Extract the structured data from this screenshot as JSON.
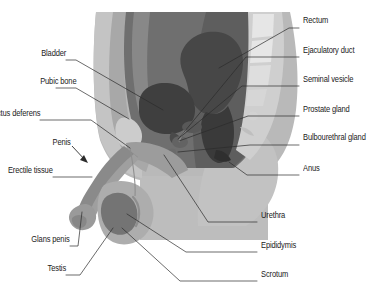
{
  "figure": {
    "type": "anatomical-diagram",
    "width": 376,
    "height": 301,
    "background_color": "#ffffff"
  },
  "palette": {
    "background": "#ffffff",
    "skin_outer": "#b9b9b9",
    "body_light": "#c4c4c4",
    "body_mid": "#a8a8a8",
    "abdomen_dark": "#6f6f6f",
    "abdomen_darker": "#5e5e5e",
    "bladder": "#3f3f3f",
    "rectum": "#474747",
    "rectum_lower": "#3a3a3a",
    "bone_light": "#d9d9d9",
    "vertebra": "#e3e3e3",
    "penis_shaft": "#8a8a8a",
    "glans": "#9a9a9a",
    "testis": "#747474",
    "scrotum": "#adadad",
    "thigh": "#bdbdbd",
    "leader_line": "#2b2b2b",
    "label_text": "#1a1a1a"
  },
  "labels": {
    "left": [
      {
        "id": "bladder",
        "text": "Bladder",
        "x": 97,
        "y": 53,
        "align": "right"
      },
      {
        "id": "pubic-bone",
        "text": "Pubic bone",
        "x": 97,
        "y": 81,
        "align": "right"
      },
      {
        "id": "ductus-deferens",
        "text": "Ductus deferens",
        "x": 97,
        "y": 113,
        "align": "right"
      },
      {
        "id": "penis",
        "text": "Penis",
        "x": 79,
        "y": 142,
        "align": "right"
      },
      {
        "id": "erectile-tissue",
        "text": "Erectile tissue",
        "x": 97,
        "y": 170,
        "align": "right"
      },
      {
        "id": "glans-penis",
        "text": "Glans penis",
        "x": 97,
        "y": 239,
        "align": "right"
      },
      {
        "id": "testis",
        "text": "Testis",
        "x": 97,
        "y": 268,
        "align": "right"
      }
    ],
    "right": [
      {
        "id": "rectum",
        "text": "Rectum",
        "x": 303,
        "y": 20,
        "align": "left"
      },
      {
        "id": "ejaculatory-duct",
        "text": "Ejaculatory duct",
        "x": 303,
        "y": 50,
        "align": "left"
      },
      {
        "id": "seminal-vesicle",
        "text": "Seminal vesicle",
        "x": 303,
        "y": 79,
        "align": "left"
      },
      {
        "id": "prostate-gland",
        "text": "Prostate gland",
        "x": 303,
        "y": 109,
        "align": "left"
      },
      {
        "id": "bulbourethral-gland",
        "text": "Bulbourethral gland",
        "x": 303,
        "y": 137,
        "align": "left"
      },
      {
        "id": "anus",
        "text": "Anus",
        "x": 303,
        "y": 168,
        "align": "left"
      },
      {
        "id": "urethra",
        "text": "Urethra",
        "x": 261,
        "y": 215,
        "align": "left"
      },
      {
        "id": "epididymis",
        "text": "Epididymis",
        "x": 261,
        "y": 245,
        "align": "left"
      },
      {
        "id": "scrotum",
        "text": "Scrotum",
        "x": 261,
        "y": 274,
        "align": "left"
      }
    ]
  },
  "leader_lines": {
    "stroke_color": "#2b2b2b",
    "stroke_width": 0.7,
    "items": [
      {
        "id": "leader-bladder",
        "points": "66,60 76,60 163,110"
      },
      {
        "id": "leader-pubic-bone",
        "points": "56,88 76,88 129,119"
      },
      {
        "id": "leader-ductus-deferens",
        "points": "40,120 91,120 130,148"
      },
      {
        "id": "leader-erectile-tissue",
        "points": "53,177 92,177"
      },
      {
        "id": "leader-glans-penis",
        "points": "70,246 78,246 82,212"
      },
      {
        "id": "leader-testis",
        "points": "66,275 80,275 113,228"
      },
      {
        "id": "leader-rectum",
        "points": "299,28 289,28 219,68"
      },
      {
        "id": "leader-ejaculatory-duct",
        "points": "299,57 246,57 180,137"
      },
      {
        "id": "leader-seminal-vesicle",
        "points": "299,86 242,86 178,139"
      },
      {
        "id": "leader-prostate-gland",
        "points": "299,116 248,116 179,141"
      },
      {
        "id": "leader-bulbourethral-gland",
        "points": "299,145 250,145 178,152"
      },
      {
        "id": "leader-anus",
        "points": "299,175 247,175 229,162"
      },
      {
        "id": "leader-urethra",
        "points": "257,222 208,222 164,155"
      },
      {
        "id": "leader-epididymis",
        "points": "257,252 186,252 127,214"
      },
      {
        "id": "leader-scrotum",
        "points": "257,281 180,281 122,228"
      }
    ],
    "arrow": {
      "id": "arrow-penis",
      "from_x": 72,
      "from_y": 146,
      "to_x": 88,
      "to_y": 163
    }
  },
  "structures": [
    {
      "id": "body-outline",
      "name": "body-torso"
    },
    {
      "id": "abdominal-cavity",
      "name": "abdominal-cavity"
    },
    {
      "id": "bladder-shape",
      "name": "bladder"
    },
    {
      "id": "rectum-shape",
      "name": "rectum"
    },
    {
      "id": "sacrum-shape",
      "name": "sacrum-vertebrae"
    },
    {
      "id": "pubic-bone-shape",
      "name": "pubic-bone"
    },
    {
      "id": "penis-shape",
      "name": "penis"
    },
    {
      "id": "glans-shape",
      "name": "glans-penis"
    },
    {
      "id": "scrotum-shape",
      "name": "scrotum"
    },
    {
      "id": "testis-shape",
      "name": "testis"
    },
    {
      "id": "thigh-shape",
      "name": "thigh"
    }
  ]
}
